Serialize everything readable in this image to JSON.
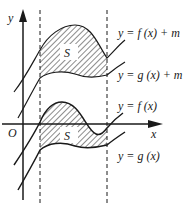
{
  "diagram": {
    "axes": {
      "x_label": "x",
      "y_label": "y",
      "origin_label": "O"
    },
    "region_label_top": "S",
    "region_label_bottom": "S",
    "curve_labels": {
      "f_plus_m": "y = f (x) + m",
      "g_plus_m": "y = g (x) + m",
      "f": "y = f (x)",
      "g": "y = g (x)"
    },
    "colors": {
      "stroke": "#1a1a1a",
      "background": "#ffffff"
    }
  }
}
